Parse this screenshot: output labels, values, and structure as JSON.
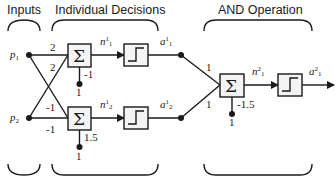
{
  "headers": {
    "inputs": "Inputs",
    "individual": "Individual Decisions",
    "and_op": "AND Operation"
  },
  "inputs": {
    "p1": {
      "sym": "p",
      "sub": "1"
    },
    "p2": {
      "sym": "p",
      "sub": "2"
    }
  },
  "layer1": {
    "weights": {
      "w11": "2",
      "w12": "2",
      "w21": "-1",
      "w22": "-1"
    },
    "neuron1": {
      "bias": "-1",
      "bias_input": "1",
      "n_sym": "n",
      "n_sup": "1",
      "n_sub": "1",
      "a_sym": "a",
      "a_sup": "1",
      "a_sub": "1"
    },
    "neuron2": {
      "bias": "1.5",
      "bias_input": "1",
      "n_sym": "n",
      "n_sup": "1",
      "n_sub": "2",
      "a_sym": "a",
      "a_sup": "1",
      "a_sub": "2"
    }
  },
  "layer2": {
    "weights": {
      "w1": "1",
      "w2": "1"
    },
    "bias": "-1.5",
    "bias_input": "1",
    "n_sym": "n",
    "n_sup": "2",
    "n_sub": "1",
    "a_sym": "a",
    "a_sup": "2",
    "a_sub": "1"
  },
  "symbols": {
    "sum": "Σ"
  },
  "colors": {
    "stroke": "#1a1a1a",
    "box_fill": "#f4f4f4",
    "background": "#ffffff"
  }
}
